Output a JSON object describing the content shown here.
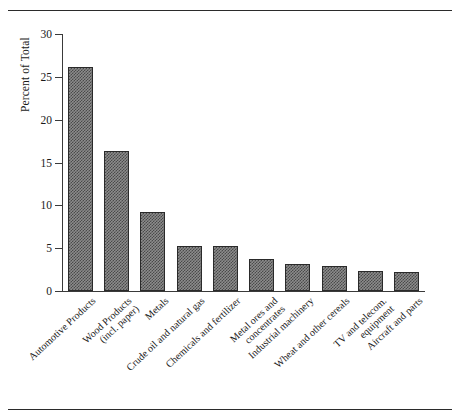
{
  "figure": {
    "top_rule": "horizontal-rule",
    "bottom_rule": "horizontal-rule"
  },
  "chart_data": {
    "type": "bar",
    "title": "",
    "xlabel": "",
    "ylabel": "Percent of Total",
    "ylim": [
      0,
      30
    ],
    "yticks": [
      0,
      5,
      10,
      15,
      20,
      25,
      30
    ],
    "ytick_labels": [
      "0",
      "5",
      "10",
      "15",
      "20",
      "25",
      "30"
    ],
    "grid": false,
    "legend": null,
    "bar_style": {
      "fill": "checkerboard-hatch",
      "fill_color": "#8c8c8c",
      "hatch_color": "#4a4a4a",
      "edge_color": "#2a2a2a"
    },
    "categories": [
      "Automotive Products",
      "Wood Products (incl. paper)",
      "Metals",
      "Crude oil and natural gas",
      "Chemicals and fertilizer",
      "Metal ores and concentrates",
      "Industrial machinery",
      "Wheat and other cereals",
      "TV and telecom. equipment",
      "Aircraft and parts"
    ],
    "category_lines": [
      [
        "Automotive Products"
      ],
      [
        "Wood Products",
        "(incl. paper)"
      ],
      [
        "Metals"
      ],
      [
        "Crude oil and natural gas"
      ],
      [
        "Chemicals and fertilizer"
      ],
      [
        "Metal ores and",
        "concentrates"
      ],
      [
        "Industrial machinery"
      ],
      [
        "Wheat and other cereals"
      ],
      [
        "TV and telecom.",
        "equipment"
      ],
      [
        "Aircraft and parts"
      ]
    ],
    "values": [
      26.1,
      16.3,
      9.2,
      5.3,
      5.2,
      3.7,
      3.1,
      2.9,
      2.3,
      2.2
    ]
  }
}
